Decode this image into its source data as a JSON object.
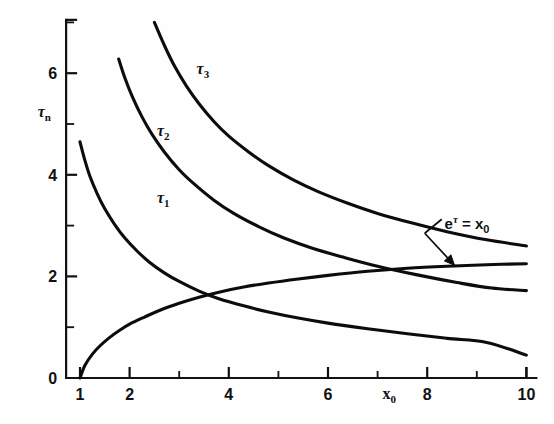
{
  "chart_data": {
    "type": "line",
    "title": "",
    "xlabel": "x_0",
    "ylabel": "tau_n",
    "xlim": [
      0.72,
      10.2
    ],
    "ylim": [
      0,
      7.05
    ],
    "grid": false,
    "legend_position": "inline-curve-labels",
    "x_ticks_major": [
      1,
      2,
      4,
      6,
      8,
      10
    ],
    "x_ticks_minor": [
      3,
      5,
      7,
      9
    ],
    "x_tick_labels": [
      "1",
      "2",
      "4",
      "6",
      "8",
      "10"
    ],
    "y_ticks_major": [
      0,
      2,
      4,
      6
    ],
    "y_ticks_minor": [
      1,
      3,
      5,
      7
    ],
    "y_tick_labels": [
      "0",
      "2",
      "4",
      "6"
    ],
    "series": [
      {
        "name": "tau_1",
        "label": "τ",
        "label_sub": "1",
        "label_x": 2.55,
        "label_y": 3.45,
        "points": [
          [
            1.0,
            4.65
          ],
          [
            1.1,
            4.28
          ],
          [
            1.2,
            3.97
          ],
          [
            1.35,
            3.62
          ],
          [
            1.5,
            3.33
          ],
          [
            1.7,
            3.02
          ],
          [
            1.9,
            2.76
          ],
          [
            2.15,
            2.5
          ],
          [
            2.4,
            2.28
          ],
          [
            2.7,
            2.07
          ],
          [
            3.0,
            1.9
          ],
          [
            3.4,
            1.71
          ],
          [
            3.8,
            1.56
          ],
          [
            4.3,
            1.42
          ],
          [
            4.8,
            1.3
          ],
          [
            5.4,
            1.18
          ],
          [
            6.0,
            1.08
          ],
          [
            6.8,
            0.97
          ],
          [
            7.6,
            0.87
          ],
          [
            8.4,
            0.78
          ],
          [
            9.2,
            0.7
          ],
          [
            10.0,
            0.45
          ]
        ]
      },
      {
        "name": "tau_2",
        "label": "τ",
        "label_sub": "2",
        "label_x": 2.55,
        "label_y": 4.77,
        "points": [
          [
            1.78,
            6.28
          ],
          [
            1.9,
            5.92
          ],
          [
            2.05,
            5.55
          ],
          [
            2.25,
            5.14
          ],
          [
            2.45,
            4.8
          ],
          [
            2.7,
            4.45
          ],
          [
            3.0,
            4.1
          ],
          [
            3.3,
            3.82
          ],
          [
            3.7,
            3.5
          ],
          [
            4.1,
            3.24
          ],
          [
            4.6,
            2.98
          ],
          [
            5.1,
            2.76
          ],
          [
            5.7,
            2.55
          ],
          [
            6.3,
            2.38
          ],
          [
            7.0,
            2.2
          ],
          [
            7.8,
            2.03
          ],
          [
            8.6,
            1.88
          ],
          [
            9.3,
            1.77
          ],
          [
            10.0,
            1.72
          ]
        ]
      },
      {
        "name": "tau_3",
        "label": "τ",
        "label_sub": "3",
        "label_x": 3.35,
        "label_y": 5.98,
        "points": [
          [
            2.5,
            7.0
          ],
          [
            2.7,
            6.55
          ],
          [
            2.9,
            6.15
          ],
          [
            3.15,
            5.74
          ],
          [
            3.4,
            5.4
          ],
          [
            3.7,
            5.05
          ],
          [
            4.0,
            4.76
          ],
          [
            4.4,
            4.45
          ],
          [
            4.8,
            4.18
          ],
          [
            5.3,
            3.9
          ],
          [
            5.8,
            3.67
          ],
          [
            6.4,
            3.44
          ],
          [
            7.0,
            3.24
          ],
          [
            7.7,
            3.05
          ],
          [
            8.4,
            2.88
          ],
          [
            9.2,
            2.72
          ],
          [
            10.0,
            2.6
          ]
        ]
      },
      {
        "name": "e_tau_equals_x0",
        "label": "",
        "label_sub": "",
        "label_x": 0,
        "label_y": 0,
        "points": [
          [
            1.0,
            0.0
          ],
          [
            1.1,
            0.25
          ],
          [
            1.25,
            0.47
          ],
          [
            1.4,
            0.63
          ],
          [
            1.6,
            0.8
          ],
          [
            1.8,
            0.94
          ],
          [
            2.0,
            1.06
          ],
          [
            2.3,
            1.2
          ],
          [
            2.6,
            1.33
          ],
          [
            3.0,
            1.47
          ],
          [
            3.4,
            1.59
          ],
          [
            3.8,
            1.69
          ],
          [
            4.3,
            1.79
          ],
          [
            4.8,
            1.87
          ],
          [
            5.4,
            1.95
          ],
          [
            6.0,
            2.02
          ],
          [
            6.8,
            2.1
          ],
          [
            7.6,
            2.16
          ],
          [
            8.4,
            2.2
          ],
          [
            9.2,
            2.23
          ],
          [
            10.0,
            2.25
          ]
        ]
      }
    ],
    "annotations": [
      {
        "name": "e-tau-equals-x0-label",
        "text_base": "e",
        "text_sup": "τ",
        "text_eq": " = x",
        "text_sub": "0",
        "x": 8.35,
        "y": 2.93,
        "arrow_from_x": 7.95,
        "arrow_from_y": 2.85,
        "arrow_to_x": 8.55,
        "arrow_to_y": 2.22
      }
    ],
    "axis_label_x": {
      "base": "x",
      "sub": "0",
      "x": 7.1,
      "y": -0.42
    },
    "axis_label_y": {
      "base": "τ",
      "sub": "n",
      "x": 0.28,
      "y": 5.13
    }
  },
  "colors": {
    "curve": "#0c0c0c",
    "axis": "#111111",
    "background": "#fefefe"
  }
}
